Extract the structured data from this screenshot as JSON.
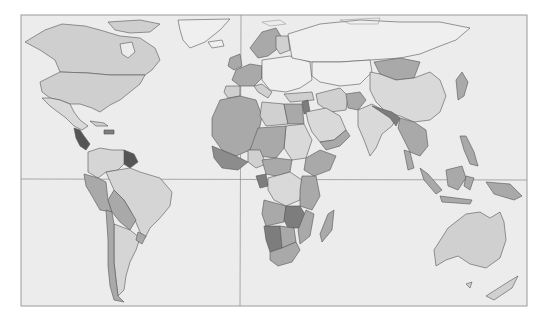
{
  "figure": {
    "type": "choropleth-world-map",
    "title": "",
    "legend": null,
    "text_labels": [],
    "graticule": {
      "equator": true,
      "prime_meridian": true
    },
    "frame": {
      "x": 21,
      "y": 15,
      "width": 506,
      "height": 291
    }
  },
  "colors": {
    "background": "#ffffff",
    "ocean": "#ececec",
    "frame": "#9a9a9a",
    "shade_none": "#efefef",
    "shade_light": "#cfcfcf",
    "shade_medium": "#a9a9a9",
    "shade_dark": "#7d7d7d",
    "shade_darkest": "#555555"
  },
  "regions": [
    {
      "name": "North America (Canada/USA)",
      "shade": "light"
    },
    {
      "name": "Greenland",
      "shade": "none"
    },
    {
      "name": "Mexico",
      "shade": "light"
    },
    {
      "name": "Central America (Guatemala/Honduras/Nicaragua)",
      "shade": "darkest"
    },
    {
      "name": "Caribbean (Haiti)",
      "shade": "dark"
    },
    {
      "name": "Guyana/Suriname",
      "shade": "darkest"
    },
    {
      "name": "Venezuela/Colombia",
      "shade": "light"
    },
    {
      "name": "Ecuador/Peru",
      "shade": "medium"
    },
    {
      "name": "Brazil",
      "shade": "light"
    },
    {
      "name": "Bolivia/Paraguay",
      "shade": "medium"
    },
    {
      "name": "Argentina",
      "shade": "light"
    },
    {
      "name": "Chile",
      "shade": "medium"
    },
    {
      "name": "Uruguay",
      "shade": "medium"
    },
    {
      "name": "Western Europe",
      "shade": "medium"
    },
    {
      "name": "Scandinavia",
      "shade": "medium"
    },
    {
      "name": "Eastern Europe",
      "shade": "none"
    },
    {
      "name": "Russia",
      "shade": "none"
    },
    {
      "name": "North Africa / Sahel",
      "shade": "medium"
    },
    {
      "name": "Egypt",
      "shade": "medium"
    },
    {
      "name": "Libya",
      "shade": "light"
    },
    {
      "name": "Arabian Peninsula",
      "shade": "light"
    },
    {
      "name": "Central Africa",
      "shade": "medium"
    },
    {
      "name": "DR Congo",
      "shade": "light"
    },
    {
      "name": "Zambia/Zimbabwe",
      "shade": "dark"
    },
    {
      "name": "Namibia",
      "shade": "dark"
    },
    {
      "name": "South Africa",
      "shade": "medium"
    },
    {
      "name": "Madagascar",
      "shade": "medium"
    },
    {
      "name": "Central Asia",
      "shade": "none"
    },
    {
      "name": "Afghanistan",
      "shade": "medium"
    },
    {
      "name": "Mongolia",
      "shade": "medium"
    },
    {
      "name": "China",
      "shade": "light"
    },
    {
      "name": "India",
      "shade": "light"
    },
    {
      "name": "Nepal/Bangladesh",
      "shade": "dark"
    },
    {
      "name": "Indochina",
      "shade": "medium"
    },
    {
      "name": "Philippines",
      "shade": "medium"
    },
    {
      "name": "Indonesia",
      "shade": "medium"
    },
    {
      "name": "Papua New Guinea",
      "shade": "medium"
    },
    {
      "name": "Japan/Korea",
      "shade": "medium"
    },
    {
      "name": "Australia",
      "shade": "light"
    },
    {
      "name": "New Zealand",
      "shade": "light"
    }
  ]
}
